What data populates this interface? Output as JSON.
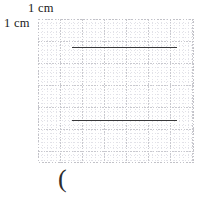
{
  "figure": {
    "title_label_top": "1 cm",
    "title_label_left": "1 cm",
    "caption_mark": "(",
    "grid": {
      "box_left_px": 38,
      "box_top_px": 19,
      "box_width_px": 156,
      "box_height_px": 144,
      "major_cell_px": 22,
      "minor_divisions_per_cell": 5,
      "major_color": "#c9c9cf",
      "minor_color": "#e2e2e8",
      "border_color": "#c2c2c8",
      "columns": 7,
      "rows": 6.5,
      "unit_label": "1 cm"
    },
    "segments": [
      {
        "name": "upper-segment",
        "x1_px": 34,
        "x2_px": 139,
        "y_px": 28,
        "color": "#39393b",
        "length_cm": 4.8
      },
      {
        "name": "lower-segment",
        "x1_px": 34,
        "x2_px": 139,
        "y_px": 101,
        "color": "#39393b",
        "length_cm": 4.8
      }
    ]
  },
  "chart_data": {
    "type": "line",
    "title": "",
    "xlabel": "",
    "ylabel": "",
    "grid": true,
    "legend_position": "none",
    "annotations": [
      "1 cm",
      "1 cm",
      "("
    ],
    "x_unit": "cm",
    "y_unit": "cm",
    "xlim": [
      0,
      7
    ],
    "ylim": [
      0,
      6.5
    ],
    "series": [
      {
        "name": "upper-segment",
        "x": [
          1.55,
          6.32
        ],
        "y": [
          5.23,
          5.23
        ]
      },
      {
        "name": "lower-segment",
        "x": [
          1.55,
          6.32
        ],
        "y": [
          1.95,
          1.95
        ]
      }
    ]
  }
}
